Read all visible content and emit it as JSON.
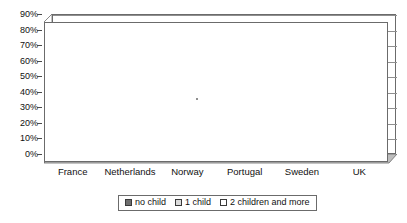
{
  "chart_data": {
    "type": "bar",
    "title": "",
    "subtitle": "",
    "xlabel": "",
    "ylabel": "",
    "categories": [
      "France",
      "Netherlands",
      "Norway",
      "Portugal",
      "Sweden",
      "UK"
    ],
    "series": [
      {
        "name": "no child",
        "values": [
          21,
          40,
          26,
          13,
          17,
          26
        ]
      },
      {
        "name": "1 child",
        "values": [
          25,
          74,
          35,
          12,
          20,
          50
        ]
      },
      {
        "name": "2 children and more",
        "values": [
          33,
          85,
          42,
          13,
          25,
          66
        ]
      }
    ],
    "ylim": [
      0,
      90
    ],
    "ytick_values": [
      0,
      10,
      20,
      30,
      40,
      50,
      60,
      70,
      80,
      90
    ],
    "ytick_labels": [
      "0%",
      "10%",
      "20%",
      "30%",
      "40%",
      "50%",
      "60%",
      "70%",
      "80%",
      "90%"
    ],
    "grid": true,
    "legend_position": "bottom",
    "style": "3d-column",
    "colors": {
      "series_0": "#7a7a7a",
      "series_1": "#d2d2d2",
      "series_2": "#ffffff",
      "axis": "#6b6b6b",
      "grid": "#8f8f8f",
      "text": "#111111"
    }
  },
  "legend": {
    "items": [
      {
        "label": "no child"
      },
      {
        "label": "1 child"
      },
      {
        "label": "2 children and more"
      }
    ]
  }
}
